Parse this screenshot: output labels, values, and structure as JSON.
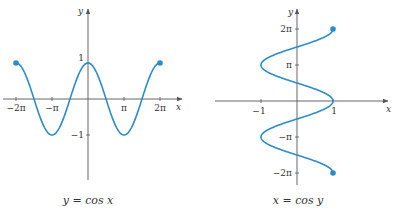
{
  "colors": {
    "curve": "#2b8ccc",
    "axis": "#555555",
    "text": "#333333"
  },
  "chart_data": [
    {
      "type": "line",
      "title": "",
      "caption": "y = cos x",
      "xlabel": "x",
      "ylabel": "y",
      "function": "y = cos(x)",
      "domain": [
        -6.2832,
        6.2832
      ],
      "xticks": [
        {
          "value": -6.2832,
          "label": "−2π"
        },
        {
          "value": -3.1416,
          "label": "−π"
        },
        {
          "value": 3.1416,
          "label": "π"
        },
        {
          "value": 6.2832,
          "label": "2π"
        }
      ],
      "yticks": [
        {
          "value": 1,
          "label": "1"
        },
        {
          "value": -1,
          "label": "−1"
        }
      ],
      "endpoints": [
        {
          "x": -6.2832,
          "y": 1
        },
        {
          "x": 6.2832,
          "y": 1
        }
      ],
      "x": [
        -6.2832,
        -4.7124,
        -3.1416,
        -1.5708,
        0,
        1.5708,
        3.1416,
        4.7124,
        6.2832
      ],
      "values": [
        1,
        0,
        -1,
        0,
        1,
        0,
        -1,
        0,
        1
      ],
      "grid": false
    },
    {
      "type": "line",
      "title": "",
      "caption": "x = cos y",
      "xlabel": "x",
      "ylabel": "y",
      "function": "x = cos(y)",
      "range": [
        -6.2832,
        6.2832
      ],
      "xticks": [
        {
          "value": -1,
          "label": "−1"
        },
        {
          "value": 1,
          "label": "1"
        }
      ],
      "yticks": [
        {
          "value": 6.2832,
          "label": "2π"
        },
        {
          "value": 3.1416,
          "label": "π"
        },
        {
          "value": -3.1416,
          "label": "−π"
        },
        {
          "value": -6.2832,
          "label": "−2π"
        }
      ],
      "endpoints": [
        {
          "x": 1,
          "y": 6.2832
        },
        {
          "x": 1,
          "y": -6.2832
        }
      ],
      "y": [
        -6.2832,
        -4.7124,
        -3.1416,
        -1.5708,
        0,
        1.5708,
        3.1416,
        4.7124,
        6.2832
      ],
      "values": [
        1,
        0,
        -1,
        0,
        1,
        0,
        -1,
        0,
        1
      ],
      "grid": false
    }
  ],
  "labels": {
    "left": {
      "x_axis": "x",
      "y_axis": "y",
      "caption": "y = cos x"
    },
    "right": {
      "x_axis": "x",
      "y_axis": "y",
      "caption": "x = cos y"
    }
  }
}
